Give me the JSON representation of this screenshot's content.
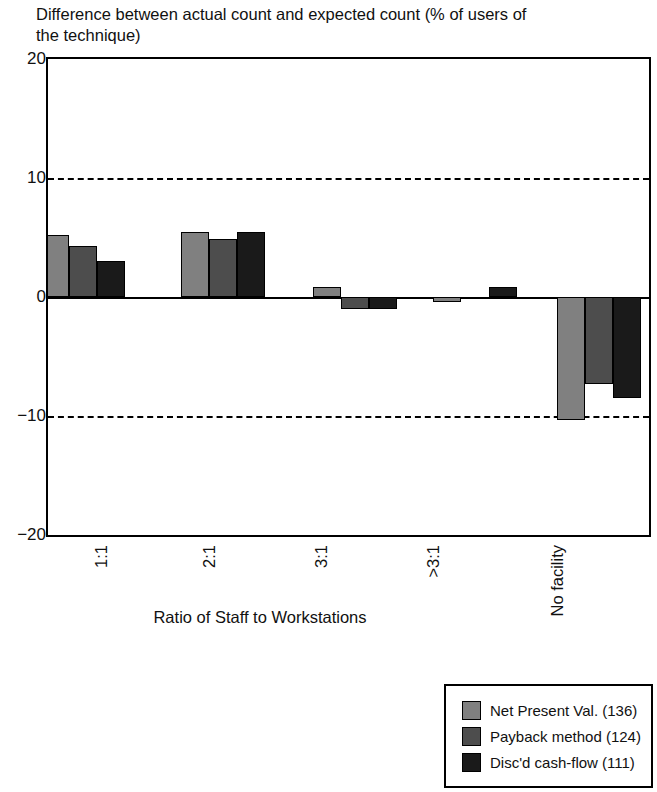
{
  "chart_data": {
    "type": "bar",
    "title": "Difference between actual count and expected count (% of users of the technique)",
    "xlabel": "Ratio of Staff to Workstations",
    "ylabel": "",
    "categories": [
      "1:1",
      "2:1",
      "3:1",
      ">3:1",
      "No facility"
    ],
    "series": [
      {
        "name": "Net Present Val. (136)",
        "color": "#808080",
        "values": [
          5.2,
          5.5,
          0.8,
          -0.4,
          -10.3
        ]
      },
      {
        "name": "Payback method (124)",
        "color": "#4d4d4d",
        "values": [
          4.3,
          4.9,
          -1.0,
          -0.1,
          -7.3
        ]
      },
      {
        "name": "Disc'd cash-flow (111)",
        "color": "#1a1a1a",
        "values": [
          3.0,
          5.5,
          -1.0,
          0.8,
          -8.5
        ]
      }
    ],
    "ylim": [
      -20,
      20
    ],
    "yticks": [
      "20",
      "10",
      "0",
      "-10",
      "-20"
    ],
    "ytick_values": [
      20,
      10,
      0,
      -10,
      -20
    ],
    "gridlines": [
      10,
      -10
    ],
    "grid": true,
    "zero_line": 0,
    "legend_position": "bottom-right"
  },
  "axis": {
    "y_tick_labels": [
      "20",
      "10",
      "0",
      "−10",
      "−20"
    ],
    "x_tick_labels": [
      "1:1",
      "2:1",
      "3:1",
      ">3:1",
      "No facility"
    ],
    "x_axis_title": "Ratio of Staff to Workstations"
  },
  "title": {
    "text": "Difference between actual count and expected count (% of users of\nthe technique)"
  },
  "legend": {
    "items": [
      {
        "label": "Net Present Val. (136)",
        "color": "#808080"
      },
      {
        "label": "Payback method (124)",
        "color": "#4d4d4d"
      },
      {
        "label": "Disc'd cash-flow (111)",
        "color": "#1a1a1a"
      }
    ]
  }
}
